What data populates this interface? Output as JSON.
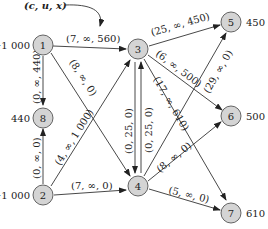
{
  "legend": {
    "label": "(c, u, x)"
  },
  "nodes": [
    {
      "id": "1",
      "supply": "−1 000",
      "x": 43,
      "y": 45
    },
    {
      "id": "2",
      "supply": "−1 000",
      "x": 43,
      "y": 195
    },
    {
      "id": "3",
      "supply": "",
      "x": 138,
      "y": 73
    },
    {
      "id": "4",
      "supply": "",
      "x": 138,
      "y": 185
    },
    {
      "id": "5",
      "supply": "450",
      "x": 232,
      "y": 22
    },
    {
      "id": "6",
      "supply": "500",
      "x": 232,
      "y": 116
    },
    {
      "id": "7",
      "supply": "610",
      "x": 232,
      "y": 211
    },
    {
      "id": "8",
      "supply": "440",
      "x": 43,
      "y": 117
    }
  ],
  "edges": [
    {
      "from": "1",
      "to": "3",
      "label": "(7, ∞, 560)"
    },
    {
      "from": "1",
      "to": "8",
      "label": "(0, ∞, 440)"
    },
    {
      "from": "1",
      "to": "4",
      "label": "(8, ∞, 0)"
    },
    {
      "from": "2",
      "to": "8",
      "label": "(0, ∞, 0)"
    },
    {
      "from": "2",
      "to": "3",
      "label": "(4, ∞, 1 000)"
    },
    {
      "from": "2",
      "to": "4",
      "label": "(7, ∞, 0)"
    },
    {
      "from": "3",
      "to": "4",
      "label": "(0, 25, 0)"
    },
    {
      "from": "4",
      "to": "3",
      "label": "(0, 25, 0)"
    },
    {
      "from": "3",
      "to": "5",
      "label": "(25, ∞, 450)"
    },
    {
      "from": "3",
      "to": "6",
      "label": "(6, ∞, 500)"
    },
    {
      "from": "3",
      "to": "7",
      "label": "(17, ∞, 610)"
    },
    {
      "from": "4",
      "to": "5",
      "label": "(29, ∞, 0)"
    },
    {
      "from": "4",
      "to": "6",
      "label": "(8, ∞, 0)"
    },
    {
      "from": "4",
      "to": "7",
      "label": "(5, ∞, 0)"
    }
  ]
}
